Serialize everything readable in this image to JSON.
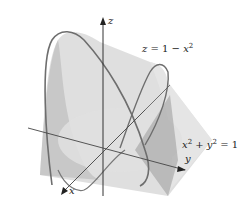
{
  "figure": {
    "surfaces": [
      {
        "name": "parabolic-cylinder",
        "equation_label": "z = 1 − x²"
      },
      {
        "name": "circular-cylinder",
        "equation_label": "x² + y² = 1"
      }
    ],
    "axes": {
      "x": "x",
      "y": "y",
      "z": "z"
    },
    "labels": {
      "surface_top": {
        "lhs": "z",
        "eq": " = 1 − ",
        "var": "x",
        "exp": "2"
      },
      "cylinder": {
        "v1": "x",
        "e1": "2",
        "plus": " + ",
        "v2": "y",
        "e2": "2",
        "rhs": " = 1"
      }
    },
    "colors": {
      "surface_fill": "#c8c8c8",
      "cylinder_fill": "#e2e2e2",
      "curve": "#6e6e6e",
      "axis": "#333333"
    }
  }
}
